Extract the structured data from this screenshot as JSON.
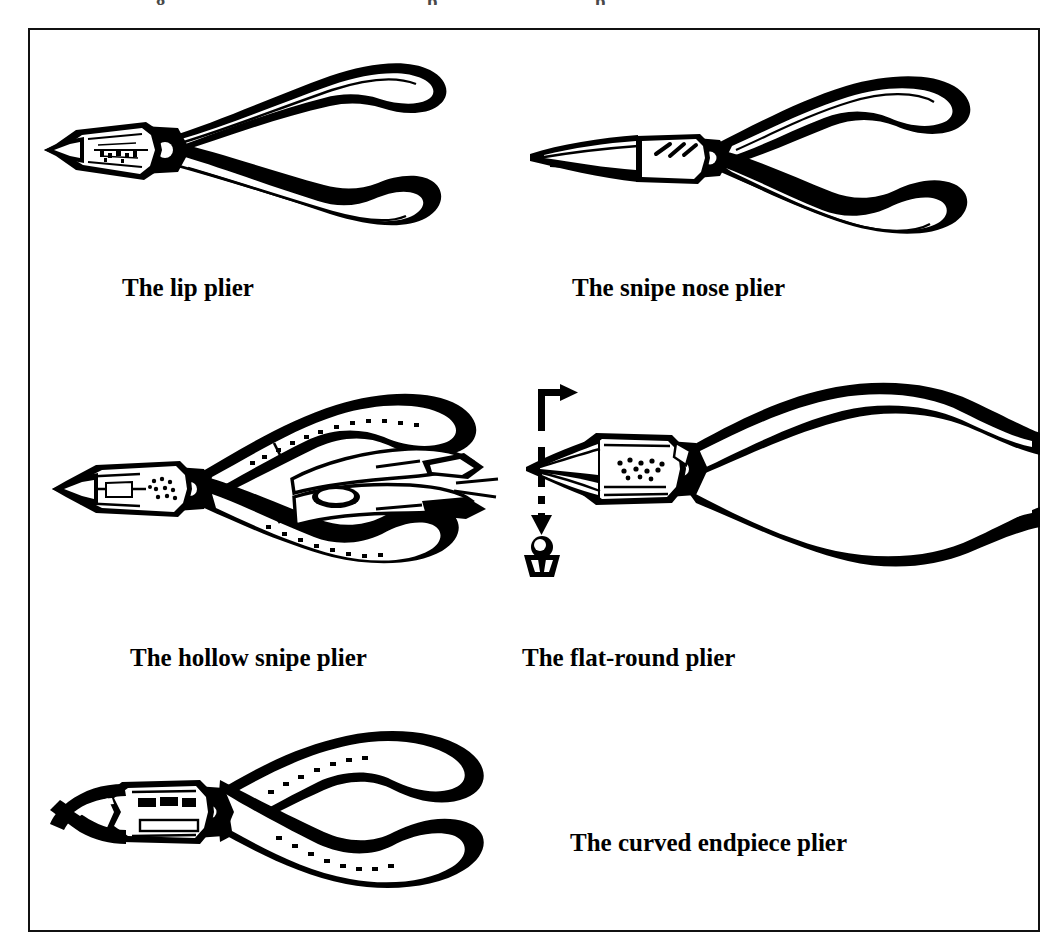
{
  "page": {
    "cropped_top_line_fragments": [
      "g",
      "p",
      "p"
    ],
    "background_color": "#ffffff",
    "ink_color": "#000000"
  },
  "figure": {
    "border_color": "#111111",
    "items": [
      {
        "id": "lip",
        "label": "The lip plier",
        "icon": "lip-plier-illustration",
        "has_callout": false
      },
      {
        "id": "snipe",
        "label": "The snipe nose plier",
        "icon": "snipe-nose-plier-illustration",
        "has_callout": false
      },
      {
        "id": "hollow",
        "label": "The hollow snipe plier",
        "icon": "hollow-snipe-plier-illustration",
        "has_callout": false
      },
      {
        "id": "flatround",
        "label": "The flat-round plier",
        "icon": "flat-round-plier-illustration",
        "has_callout": true,
        "callout": {
          "icon": "jaw-cross-section-icon",
          "description": "round-over-flat jaw profile"
        }
      },
      {
        "id": "curved",
        "label": "The curved endpiece plier",
        "icon": "curved-endpiece-plier-illustration",
        "has_callout": false
      }
    ]
  }
}
